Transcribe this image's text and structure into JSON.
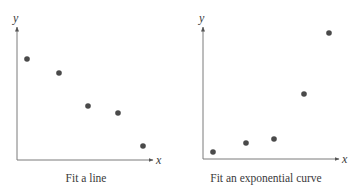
{
  "chart_data": [
    {
      "type": "scatter",
      "title": "",
      "caption": "Fit a line",
      "xlabel": "x",
      "ylabel": "y",
      "grid": false,
      "ticks": "none",
      "x": [
        1,
        2,
        3,
        4,
        5
      ],
      "y": [
        10,
        8.8,
        5.9,
        5.3,
        2.4
      ],
      "pixel_points": [
        [
          27,
          59
        ],
        [
          59,
          73
        ],
        [
          88,
          106
        ],
        [
          118,
          113
        ],
        [
          143,
          146
        ]
      ],
      "axes": {
        "origin": [
          17,
          160
        ],
        "y_top": 27,
        "x_right": 153
      },
      "trend": "decreasing linear"
    },
    {
      "type": "scatter",
      "title": "",
      "caption": "Fit an exponential curve",
      "xlabel": "x",
      "ylabel": "y",
      "grid": false,
      "ticks": "none",
      "x": [
        1,
        2,
        3,
        4,
        5
      ],
      "y": [
        0.6,
        1.4,
        1.8,
        5.6,
        11.2
      ],
      "pixel_points": [
        [
          213,
          152
        ],
        [
          246,
          143
        ],
        [
          274,
          139
        ],
        [
          304,
          94
        ],
        [
          329,
          33
        ]
      ],
      "axes": {
        "origin": [
          203,
          159
        ],
        "y_top": 27,
        "x_right": 338
      },
      "trend": "increasing exponential"
    }
  ],
  "style": {
    "point_color": "#4a4a4a",
    "axis_color": "#7a7a7a",
    "text_color": "#3a3a3a"
  }
}
